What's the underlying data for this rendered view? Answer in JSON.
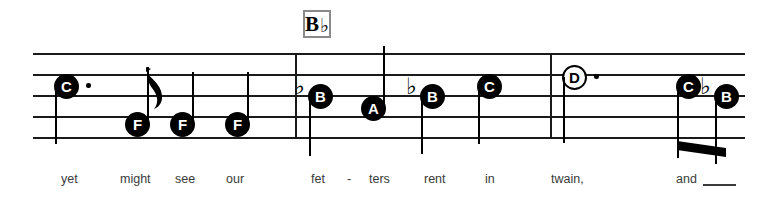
{
  "score": {
    "chord_symbol": {
      "root": "B",
      "accidental": "♭",
      "x": 303,
      "y": 10,
      "width": 28,
      "height": 28
    },
    "staff": {
      "x": 33,
      "y": 53,
      "width": 712,
      "line_gap": 21,
      "line_count": 5,
      "barlines": [
        {
          "name": "barline-1",
          "x": 295,
          "y": 53,
          "height": 85
        },
        {
          "name": "barline-2",
          "x": 550,
          "y": 53,
          "height": 85
        }
      ]
    },
    "notes": [
      {
        "id": "note-c-1",
        "letter": "C",
        "hollow": false,
        "dotted": true,
        "flat": false,
        "head_x": 54,
        "head_y": 74,
        "stem": "down",
        "stem_height": 58,
        "flag": false
      },
      {
        "id": "note-f-1",
        "letter": "F",
        "hollow": false,
        "dotted": false,
        "flat": false,
        "head_x": 125,
        "head_y": 112,
        "stem": "up",
        "stem_height": 57,
        "flag": true
      },
      {
        "id": "note-f-2",
        "letter": "F",
        "hollow": false,
        "dotted": false,
        "flat": false,
        "head_x": 170,
        "head_y": 112,
        "stem": "up",
        "stem_height": 52,
        "flag": false
      },
      {
        "id": "note-f-3",
        "letter": "F",
        "hollow": false,
        "dotted": false,
        "flat": false,
        "head_x": 225,
        "head_y": 112,
        "stem": "up",
        "stem_height": 52,
        "flag": false
      },
      {
        "id": "note-b-1",
        "letter": "B",
        "hollow": false,
        "dotted": false,
        "flat": true,
        "head_x": 308,
        "head_y": 84,
        "stem": "down",
        "stem_height": 60,
        "flag": false
      },
      {
        "id": "note-a-1",
        "letter": "A",
        "hollow": false,
        "dotted": false,
        "flat": false,
        "head_x": 361,
        "head_y": 96,
        "stem": "up",
        "stem_height": 62,
        "flag": false
      },
      {
        "id": "note-b-2",
        "letter": "B",
        "hollow": false,
        "dotted": false,
        "flat": true,
        "head_x": 420,
        "head_y": 84,
        "stem": "down",
        "stem_height": 58,
        "flag": false
      },
      {
        "id": "note-c-2",
        "letter": "C",
        "hollow": false,
        "dotted": false,
        "flat": false,
        "head_x": 477,
        "head_y": 74,
        "stem": "down",
        "stem_height": 58,
        "flag": false
      },
      {
        "id": "note-d-1",
        "letter": "D",
        "hollow": true,
        "dotted": true,
        "flat": false,
        "head_x": 562,
        "head_y": 65,
        "stem": "down",
        "stem_height": 66,
        "flag": false
      },
      {
        "id": "note-c-3",
        "letter": "C",
        "hollow": false,
        "dotted": false,
        "flat": false,
        "head_x": 676,
        "head_y": 74,
        "stem": "down",
        "stem_height": 72,
        "flag": false
      },
      {
        "id": "note-b-3",
        "letter": "B",
        "hollow": false,
        "dotted": false,
        "flat": true,
        "head_x": 714,
        "head_y": 84,
        "stem": "down",
        "stem_height": 68,
        "flag": false
      }
    ],
    "beams": [
      {
        "name": "beam-final-pair",
        "x": 677,
        "y": 141,
        "width": 49,
        "height": 9,
        "skew": 7
      }
    ],
    "lyrics": [
      {
        "text": "yet",
        "x": 61
      },
      {
        "text": "might",
        "x": 120
      },
      {
        "text": "see",
        "x": 175
      },
      {
        "text": "our",
        "x": 226
      },
      {
        "text": "fet",
        "x": 311
      },
      {
        "text": "-",
        "x": 347
      },
      {
        "text": "ters",
        "x": 369
      },
      {
        "text": "rent",
        "x": 424
      },
      {
        "text": "in",
        "x": 485
      },
      {
        "text": "twain,",
        "x": 551
      },
      {
        "text": "and",
        "x": 676
      }
    ],
    "melisma": {
      "name": "melisma-line",
      "x": 703,
      "width": 33
    }
  }
}
